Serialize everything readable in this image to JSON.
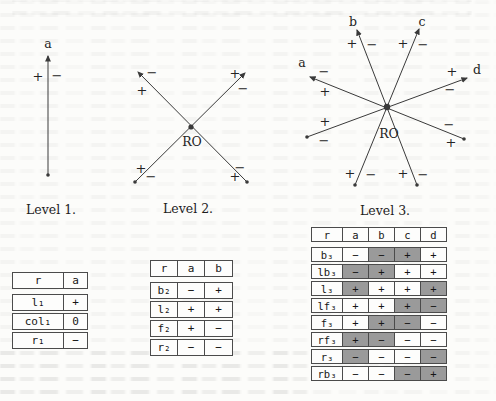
{
  "colors": {
    "shaded_cell": "#9a9a9a",
    "line": "#3a3a3a",
    "paper": "#fcfcfa"
  },
  "diagrams": {
    "level1": {
      "caption": "Level 1.",
      "axis_label": "a",
      "left_sign": "+",
      "right_sign": "−"
    },
    "level2": {
      "caption": "Level 2.",
      "center_label": "RO",
      "upper_left_head": {
        "right_sign": "−",
        "below_sign": "+"
      },
      "upper_right_head": {
        "left_sign": "+",
        "below_sign": "−"
      },
      "lower_left_end": {
        "above_sign": "+",
        "right_sign": "−"
      },
      "lower_right_end": {
        "above_sign": "−",
        "left_sign": "+"
      }
    },
    "level3": {
      "caption": "Level 3.",
      "center_label": "RO",
      "axis_labels": {
        "a": "a",
        "b": "b",
        "c": "c",
        "d": "d"
      },
      "a_head": {
        "above_sign": "−",
        "below_sign": "+"
      },
      "b_head": {
        "left_sign": "+",
        "right_sign": "−"
      },
      "c_head": {
        "left_sign": "+",
        "right_sign": "−"
      },
      "d_head": {
        "above_sign": "+",
        "below_sign": "−"
      },
      "left_end": {
        "above_sign": "+",
        "below_sign": "−"
      },
      "right_end": {
        "above_sign": "−",
        "below_sign": "+"
      },
      "bottom_left_end": {
        "left_sign": "+",
        "right_sign": "−"
      },
      "bottom_right_end": {
        "left_sign": "+",
        "right_sign": "−"
      }
    }
  },
  "tables": {
    "level1": {
      "headers": [
        "r",
        "a"
      ],
      "rows": [
        {
          "label": "l₁",
          "cells": [
            {
              "v": "+"
            }
          ]
        },
        {
          "label": "col₁",
          "cells": [
            {
              "v": "0"
            }
          ]
        },
        {
          "label": "r₁",
          "cells": [
            {
              "v": "−"
            }
          ]
        }
      ]
    },
    "level2": {
      "headers": [
        "r",
        "a",
        "b"
      ],
      "rows": [
        {
          "label": "b₂",
          "cells": [
            {
              "v": "−"
            },
            {
              "v": "+"
            }
          ]
        },
        {
          "label": "l₂",
          "cells": [
            {
              "v": "+"
            },
            {
              "v": "+"
            }
          ]
        },
        {
          "label": "f₂",
          "cells": [
            {
              "v": "+"
            },
            {
              "v": "−"
            }
          ]
        },
        {
          "label": "r₂",
          "cells": [
            {
              "v": "−"
            },
            {
              "v": "−"
            }
          ]
        }
      ]
    },
    "level3": {
      "headers": [
        "r",
        "a",
        "b",
        "c",
        "d"
      ],
      "rows": [
        {
          "label": "b₃",
          "cells": [
            {
              "v": "−",
              "shaded": false
            },
            {
              "v": "−",
              "shaded": true
            },
            {
              "v": "+",
              "shaded": true
            },
            {
              "v": "+",
              "shaded": false
            }
          ]
        },
        {
          "label": "lb₃",
          "cells": [
            {
              "v": "−",
              "shaded": true
            },
            {
              "v": "+",
              "shaded": true
            },
            {
              "v": "+",
              "shaded": false
            },
            {
              "v": "+",
              "shaded": false
            }
          ]
        },
        {
          "label": "l₃",
          "cells": [
            {
              "v": "+",
              "shaded": true
            },
            {
              "v": "+",
              "shaded": false
            },
            {
              "v": "+",
              "shaded": false
            },
            {
              "v": "+",
              "shaded": true
            }
          ]
        },
        {
          "label": "lf₃",
          "cells": [
            {
              "v": "+",
              "shaded": false
            },
            {
              "v": "+",
              "shaded": false
            },
            {
              "v": "+",
              "shaded": true
            },
            {
              "v": "−",
              "shaded": true
            }
          ]
        },
        {
          "label": "f₃",
          "cells": [
            {
              "v": "+",
              "shaded": false
            },
            {
              "v": "+",
              "shaded": true
            },
            {
              "v": "−",
              "shaded": true
            },
            {
              "v": "−",
              "shaded": false
            }
          ]
        },
        {
          "label": "rf₃",
          "cells": [
            {
              "v": "+",
              "shaded": true
            },
            {
              "v": "−",
              "shaded": true
            },
            {
              "v": "−",
              "shaded": false
            },
            {
              "v": "−",
              "shaded": false
            }
          ]
        },
        {
          "label": "r₃",
          "cells": [
            {
              "v": "−",
              "shaded": true
            },
            {
              "v": "−",
              "shaded": false
            },
            {
              "v": "−",
              "shaded": false
            },
            {
              "v": "−",
              "shaded": true
            }
          ]
        },
        {
          "label": "rb₃",
          "cells": [
            {
              "v": "−",
              "shaded": false
            },
            {
              "v": "−",
              "shaded": false
            },
            {
              "v": "−",
              "shaded": true
            },
            {
              "v": "+",
              "shaded": true
            }
          ]
        }
      ]
    }
  }
}
